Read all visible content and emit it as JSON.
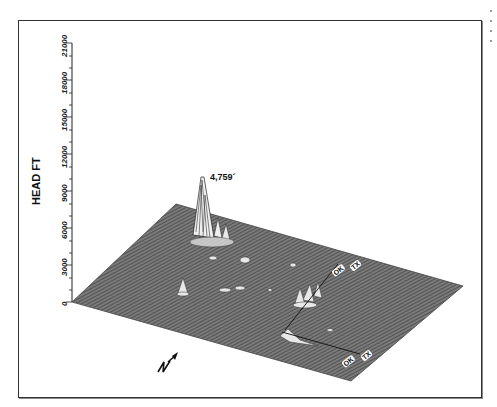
{
  "figure": {
    "type": "3d-surface-plot",
    "y_axis": {
      "label": "HEAD FT",
      "ticks": [
        "0",
        "3000",
        "6000",
        "9000",
        "12000",
        "15000",
        "18000",
        "21000"
      ]
    },
    "peak_annotation": "4,759´",
    "state_labels": [
      {
        "text": "OK",
        "position": "upper"
      },
      {
        "text": "TX",
        "position": "upper"
      },
      {
        "text": "OK",
        "position": "lower"
      },
      {
        "text": "TX",
        "position": "lower"
      }
    ],
    "north_arrow": "N",
    "colors": {
      "surface": "#6e6e6e",
      "hatch": "#3a3a3a",
      "highlight": "#f2f2f2",
      "frame": "#333333"
    }
  }
}
